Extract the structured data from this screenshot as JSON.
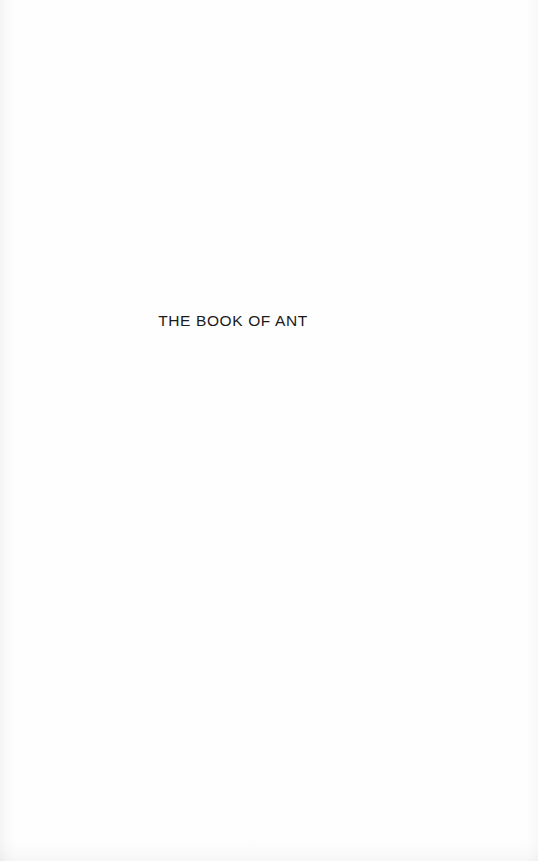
{
  "page": {
    "kind": "half-title-page",
    "background_color": "#fefefe",
    "text_color": "#1a1a1a",
    "width": 538,
    "height": 861
  },
  "content": {
    "half_title": "THE BOOK OF ANT"
  },
  "artifacts": {
    "gutter_shadow_edge": "left",
    "noise_edges": "bottom, right"
  }
}
